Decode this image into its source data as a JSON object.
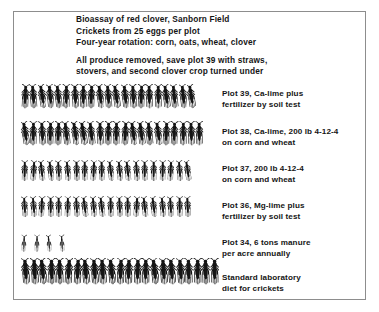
{
  "figure": {
    "caption_lines_group1": [
      "Bioassay of red clover, Sanborn Field",
      "Crickets from 25 eggs per plot",
      "Four-year rotation: corn, oats, wheat, clover"
    ],
    "caption_lines_group2": [
      "All produce removed, save plot 39 with straws,",
      "stovers, and second clover crop turned under"
    ],
    "ink_color": "#151515",
    "frame_color": "#8d8d8d",
    "background_color": "#ffffff"
  },
  "chart_data": {
    "type": "bar",
    "title": "Bioassay of red clover, Sanborn Field",
    "subtitle": "Crickets from 25 eggs per plot",
    "xlabel": "",
    "ylabel": "",
    "unit": "crickets surviving per 25 eggs",
    "glyph": "cricket-silhouette",
    "orientation": "horizontal",
    "xlim": [
      0,
      25
    ],
    "grid": false,
    "legend": false,
    "categories": [
      "Plot 39, Ca-lime plus fertilizer by soil test",
      "Plot 38, Ca-lime, 200 lb 4-12-4 on corn and wheat",
      "Plot 37, 200 lb 4-12-4 on corn and wheat",
      "Plot 36, Mg-lime plus fertilizer by soil test",
      "Plot 34, 6 tons manure per acre annually",
      "Standard laboratory diet for crickets"
    ],
    "values": [
      21,
      22,
      20,
      20,
      4,
      23
    ],
    "rows": [
      {
        "count": 21,
        "label_lines": [
          "Plot 39, Ca-lime plus",
          "fertilizer by soil test"
        ],
        "size": "medium"
      },
      {
        "count": 22,
        "label_lines": [
          "Plot 38, Ca-lime, 200 lb  4-12-4",
          "on corn and wheat"
        ],
        "size": "medium"
      },
      {
        "count": 20,
        "label_lines": [
          "Plot 37, 200 lb  4-12-4",
          "on corn and wheat"
        ],
        "size": "small"
      },
      {
        "count": 20,
        "label_lines": [
          "Plot 36, Mg-lime plus",
          "fertilizer by soil test"
        ],
        "size": "small"
      },
      {
        "count": 4,
        "label_lines": [
          "Plot 34, 6 tons manure",
          "per acre annually"
        ],
        "size": "tiny"
      },
      {
        "count": 23,
        "label_lines": [
          "Standard laboratory",
          "diet for crickets"
        ],
        "size": "large"
      }
    ]
  }
}
